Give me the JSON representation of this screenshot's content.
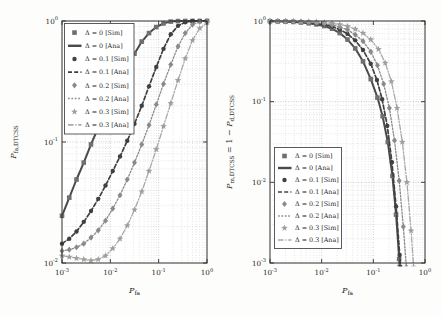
{
  "figure": {
    "background": "#fdfdfc",
    "axis_color": "#2e2e2e",
    "grid_major_color": "#a6a6a6",
    "grid_minor_color": "#c9c9c9",
    "text_color": "#1f1f1f"
  },
  "chart_data": [
    {
      "name": "false-alarm-plot",
      "type": "line",
      "title": "",
      "x_scale": "log",
      "y_scale": "log",
      "points_are": "log10 exponents [x,y]",
      "xlim_exp": [
        -3,
        0
      ],
      "ylim_exp": [
        -2,
        0
      ],
      "x_tick_exponents": [
        -3,
        -2,
        -1,
        0
      ],
      "y_tick_exponents": [
        0,
        -1,
        -2
      ],
      "x_tick_labels": [
        "10⁻³",
        "10⁻²",
        "10⁻¹",
        "10⁰"
      ],
      "y_tick_labels": [
        "10⁰",
        "10⁻¹",
        "10⁻²"
      ],
      "xlabel": "P_fa",
      "ylabel": "P_fa,DTCSS",
      "xlabel_parts": [
        {
          "text": "P",
          "kind": "var"
        },
        {
          "text": "fa",
          "kind": "sub"
        }
      ],
      "ylabel_parts": [
        {
          "text": "P",
          "kind": "var"
        },
        {
          "text": "fa,DTCSS",
          "kind": "sub"
        }
      ],
      "grid": true,
      "legend_position": "top-left",
      "series": [
        {
          "delta": "0",
          "sim_label": "Δ = 0 [Sim]",
          "ana_label": "Δ = 0 [Ana]",
          "marker": "square",
          "line_style": "solid",
          "line_color": "#4a4a4a",
          "marker_color": "#6f6f6f",
          "line_width": 2.0,
          "points_log10": [
            [
              -3,
              -1.61
            ],
            [
              -2.85,
              -1.46
            ],
            [
              -2.7,
              -1.31
            ],
            [
              -2.55,
              -1.17
            ],
            [
              -2.4,
              -1.02
            ],
            [
              -2.25,
              -0.88
            ],
            [
              -2.1,
              -0.74
            ],
            [
              -1.95,
              -0.61
            ],
            [
              -1.8,
              -0.48
            ],
            [
              -1.65,
              -0.37
            ],
            [
              -1.5,
              -0.27
            ],
            [
              -1.35,
              -0.17
            ],
            [
              -1.2,
              -0.1
            ],
            [
              -1.05,
              -0.05
            ],
            [
              -0.9,
              -0.02
            ],
            [
              -0.75,
              -0.005
            ],
            [
              -0.6,
              -0.001
            ],
            [
              -0.45,
              0
            ],
            [
              -0.3,
              0
            ],
            [
              -0.15,
              0
            ],
            [
              0,
              0
            ]
          ]
        },
        {
          "delta": "0.1",
          "sim_label": "Δ = 0.1 [Sim]",
          "ana_label": "Δ = 0.1 [Ana]",
          "marker": "circle",
          "line_style": "dashed",
          "line_color": "#404040",
          "marker_color": "#404040",
          "line_width": 1.7,
          "points_log10": [
            [
              -3,
              -1.84
            ],
            [
              -2.85,
              -1.8
            ],
            [
              -2.7,
              -1.74
            ],
            [
              -2.55,
              -1.66
            ],
            [
              -2.4,
              -1.57
            ],
            [
              -2.25,
              -1.47
            ],
            [
              -2.1,
              -1.36
            ],
            [
              -1.95,
              -1.24
            ],
            [
              -1.8,
              -1.12
            ],
            [
              -1.65,
              -0.99
            ],
            [
              -1.5,
              -0.85
            ],
            [
              -1.35,
              -0.7
            ],
            [
              -1.2,
              -0.54
            ],
            [
              -1.05,
              -0.38
            ],
            [
              -0.9,
              -0.23
            ],
            [
              -0.75,
              -0.11
            ],
            [
              -0.6,
              -0.04
            ],
            [
              -0.45,
              -0.01
            ],
            [
              -0.3,
              0
            ],
            [
              -0.15,
              0
            ],
            [
              0,
              0
            ]
          ]
        },
        {
          "delta": "0.2",
          "sim_label": "Δ = 0.2 [Sim]",
          "ana_label": "Δ = 0.2 [Ana]",
          "marker": "diamond",
          "line_style": "finedash",
          "line_color": "#8a8a8a",
          "marker_color": "#8a8a8a",
          "line_width": 1.3,
          "points_log10": [
            [
              -3,
              -1.9
            ],
            [
              -2.85,
              -1.89
            ],
            [
              -2.7,
              -1.87
            ],
            [
              -2.55,
              -1.84
            ],
            [
              -2.4,
              -1.79
            ],
            [
              -2.25,
              -1.73
            ],
            [
              -2.1,
              -1.65
            ],
            [
              -1.95,
              -1.55
            ],
            [
              -1.8,
              -1.44
            ],
            [
              -1.65,
              -1.31
            ],
            [
              -1.5,
              -1.17
            ],
            [
              -1.35,
              -1.02
            ],
            [
              -1.2,
              -0.86
            ],
            [
              -1.05,
              -0.69
            ],
            [
              -0.9,
              -0.52
            ],
            [
              -0.75,
              -0.36
            ],
            [
              -0.6,
              -0.21
            ],
            [
              -0.45,
              -0.1
            ],
            [
              -0.3,
              -0.03
            ],
            [
              -0.15,
              -0.006
            ],
            [
              0,
              0
            ]
          ]
        },
        {
          "delta": "0.3",
          "sim_label": "Δ = 0.3 [Sim]",
          "ana_label": "Δ = 0.3 [Ana]",
          "marker": "star",
          "line_style": "dashdot",
          "line_color": "#a8a8a8",
          "marker_color": "#9f9f9f",
          "line_width": 1.3,
          "points_log10": [
            [
              -3,
              -1.94
            ],
            [
              -2.85,
              -1.95
            ],
            [
              -2.7,
              -1.96
            ],
            [
              -2.55,
              -1.97
            ],
            [
              -2.4,
              -1.98
            ],
            [
              -2.25,
              -1.97
            ],
            [
              -2.1,
              -1.94
            ],
            [
              -1.95,
              -1.88
            ],
            [
              -1.8,
              -1.8
            ],
            [
              -1.65,
              -1.69
            ],
            [
              -1.5,
              -1.56
            ],
            [
              -1.35,
              -1.41
            ],
            [
              -1.2,
              -1.24
            ],
            [
              -1.05,
              -1.06
            ],
            [
              -0.9,
              -0.87
            ],
            [
              -0.75,
              -0.68
            ],
            [
              -0.6,
              -0.49
            ],
            [
              -0.45,
              -0.31
            ],
            [
              -0.3,
              -0.16
            ],
            [
              -0.15,
              -0.06
            ],
            [
              0,
              -0.012
            ]
          ]
        }
      ]
    },
    {
      "name": "missed-detection-plot",
      "type": "line",
      "title": "",
      "x_scale": "log",
      "y_scale": "log",
      "points_are": "log10 exponents [x,y]",
      "xlim_exp": [
        -3,
        0
      ],
      "ylim_exp": [
        -3,
        0
      ],
      "x_tick_exponents": [
        -3,
        -2,
        -1,
        0
      ],
      "y_tick_exponents": [
        0,
        -1,
        -2,
        -3
      ],
      "x_tick_labels": [
        "10⁻³",
        "10⁻²",
        "10⁻¹",
        "10⁰"
      ],
      "y_tick_labels": [
        "10⁰",
        "10⁻¹",
        "10⁻²",
        "10⁻³"
      ],
      "xlabel": "P_fa",
      "ylabel": "P_m,DTCSS = 1 − P_d,DTCSS",
      "xlabel_parts": [
        {
          "text": "P",
          "kind": "var"
        },
        {
          "text": "fa",
          "kind": "sub"
        }
      ],
      "ylabel_parts": [
        {
          "text": "P",
          "kind": "var"
        },
        {
          "text": "m,DTCSS",
          "kind": "sub"
        },
        {
          "text": " = 1 − ",
          "kind": "norm"
        },
        {
          "text": "P",
          "kind": "var"
        },
        {
          "text": "d,DTCSS",
          "kind": "sub"
        }
      ],
      "grid": true,
      "legend_position": "bottom-left",
      "series": [
        {
          "delta": "0",
          "sim_label": "Δ = 0 [Sim]",
          "ana_label": "Δ = 0 [Ana]",
          "marker": "square",
          "line_style": "solid",
          "line_color": "#4a4a4a",
          "marker_color": "#6f6f6f",
          "line_width": 2.0,
          "points_log10": [
            [
              -3,
              -0.003
            ],
            [
              -2.85,
              -0.005
            ],
            [
              -2.7,
              -0.008
            ],
            [
              -2.55,
              -0.011
            ],
            [
              -2.4,
              -0.018
            ],
            [
              -2.25,
              -0.028
            ],
            [
              -2.1,
              -0.042
            ],
            [
              -1.95,
              -0.062
            ],
            [
              -1.8,
              -0.095
            ],
            [
              -1.65,
              -0.15
            ],
            [
              -1.5,
              -0.23
            ],
            [
              -1.35,
              -0.34
            ],
            [
              -1.2,
              -0.5
            ],
            [
              -1.05,
              -0.72
            ],
            [
              -0.92,
              -0.95
            ],
            [
              -0.82,
              -1.18
            ],
            [
              -0.72,
              -1.5
            ],
            [
              -0.63,
              -1.92
            ],
            [
              -0.56,
              -2.4
            ],
            [
              -0.5,
              -2.95
            ],
            [
              -0.49,
              -3.05
            ]
          ]
        },
        {
          "delta": "0.1",
          "sim_label": "Δ = 0.1 [Sim]",
          "ana_label": "Δ = 0.1 [Ana]",
          "marker": "circle",
          "line_style": "dashed",
          "line_color": "#404040",
          "marker_color": "#404040",
          "line_width": 1.7,
          "points_log10": [
            [
              -3,
              -0.002
            ],
            [
              -2.85,
              -0.004
            ],
            [
              -2.7,
              -0.006
            ],
            [
              -2.55,
              -0.009
            ],
            [
              -2.4,
              -0.013
            ],
            [
              -2.25,
              -0.02
            ],
            [
              -2.1,
              -0.03
            ],
            [
              -1.95,
              -0.045
            ],
            [
              -1.8,
              -0.068
            ],
            [
              -1.65,
              -0.105
            ],
            [
              -1.5,
              -0.16
            ],
            [
              -1.35,
              -0.24
            ],
            [
              -1.2,
              -0.36
            ],
            [
              -1.05,
              -0.53
            ],
            [
              -0.93,
              -0.73
            ],
            [
              -0.83,
              -0.97
            ],
            [
              -0.73,
              -1.3
            ],
            [
              -0.64,
              -1.75
            ],
            [
              -0.56,
              -2.3
            ],
            [
              -0.49,
              -2.9
            ],
            [
              -0.475,
              -3.05
            ]
          ]
        },
        {
          "delta": "0.2",
          "sim_label": "Δ = 0.2 [Sim]",
          "ana_label": "Δ = 0.2 [Ana]",
          "marker": "diamond",
          "line_style": "finedash",
          "line_color": "#8a8a8a",
          "marker_color": "#8a8a8a",
          "line_width": 1.3,
          "points_log10": [
            [
              -3,
              -0.001
            ],
            [
              -2.85,
              -0.002
            ],
            [
              -2.7,
              -0.004
            ],
            [
              -2.55,
              -0.006
            ],
            [
              -2.4,
              -0.009
            ],
            [
              -2.25,
              -0.014
            ],
            [
              -2.1,
              -0.021
            ],
            [
              -1.95,
              -0.032
            ],
            [
              -1.8,
              -0.048
            ],
            [
              -1.65,
              -0.073
            ],
            [
              -1.5,
              -0.11
            ],
            [
              -1.35,
              -0.17
            ],
            [
              -1.2,
              -0.25
            ],
            [
              -1.05,
              -0.38
            ],
            [
              -0.92,
              -0.55
            ],
            [
              -0.8,
              -0.78
            ],
            [
              -0.69,
              -1.08
            ],
            [
              -0.59,
              -1.48
            ],
            [
              -0.5,
              -1.98
            ],
            [
              -0.42,
              -2.55
            ],
            [
              -0.36,
              -3.05
            ]
          ]
        },
        {
          "delta": "0.3",
          "sim_label": "Δ = 0.3 [Sim]",
          "ana_label": "Δ = 0.3 [Ana]",
          "marker": "star",
          "line_style": "dashdot",
          "line_color": "#a8a8a8",
          "marker_color": "#9f9f9f",
          "line_width": 1.3,
          "points_log10": [
            [
              -3,
              -0.001
            ],
            [
              -2.85,
              -0.001
            ],
            [
              -2.7,
              -0.002
            ],
            [
              -2.55,
              -0.003
            ],
            [
              -2.4,
              -0.005
            ],
            [
              -2.25,
              -0.008
            ],
            [
              -2.1,
              -0.012
            ],
            [
              -1.95,
              -0.018
            ],
            [
              -1.8,
              -0.028
            ],
            [
              -1.65,
              -0.043
            ],
            [
              -1.5,
              -0.065
            ],
            [
              -1.35,
              -0.1
            ],
            [
              -1.2,
              -0.15
            ],
            [
              -1.05,
              -0.23
            ],
            [
              -0.9,
              -0.35
            ],
            [
              -0.77,
              -0.52
            ],
            [
              -0.65,
              -0.75
            ],
            [
              -0.54,
              -1.08
            ],
            [
              -0.44,
              -1.5
            ],
            [
              -0.35,
              -2.0
            ],
            [
              -0.27,
              -2.6
            ],
            [
              -0.22,
              -3.05
            ]
          ]
        }
      ]
    }
  ]
}
